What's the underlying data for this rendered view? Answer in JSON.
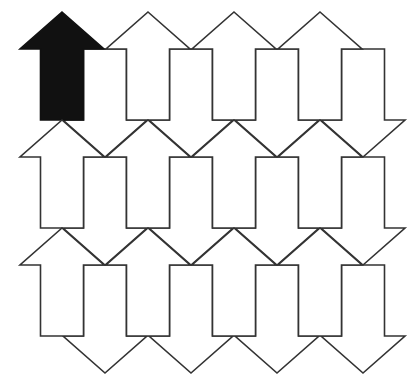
{
  "diagram": {
    "type": "arrow-tessellation",
    "colors": {
      "background": "#ffffff",
      "stroke": "#333333",
      "highlight_fill": "#111111",
      "arrow_fill": "#ffffff"
    },
    "geometry": {
      "period_x": 86,
      "period_y": 108,
      "origin_tip_x": 62,
      "origin_tip_y": 12,
      "head_height": 37,
      "head_half_width": 42,
      "shaft_half_width": 21.5,
      "shaft_length": 71
    },
    "grid": {
      "rows": 3,
      "up_columns": 4,
      "down_columns": 4
    },
    "highlighted": {
      "direction": "up",
      "row": 0,
      "col": 0
    }
  }
}
